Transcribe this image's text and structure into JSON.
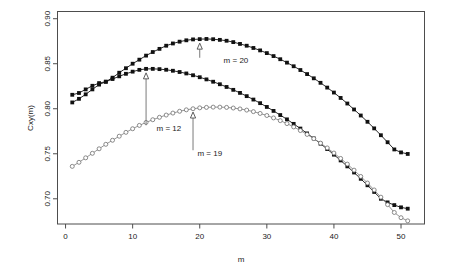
{
  "chart_data": {
    "type": "line",
    "title": "",
    "xlabel": "m",
    "ylabel": "Cxy(m)",
    "xlim": [
      -1.2,
      53.5
    ],
    "ylim": [
      0.672,
      0.908
    ],
    "grid": false,
    "legend": "none",
    "xticks": [
      "0",
      "10",
      "20",
      "30",
      "40",
      "50"
    ],
    "xtick_values": [
      0,
      10,
      20,
      30,
      40,
      50
    ],
    "yticks": [
      "0.70",
      "0.75",
      "0.80",
      "0.85",
      "0.90"
    ],
    "ytick_values": [
      0.7,
      0.75,
      0.8,
      0.85,
      0.9
    ],
    "x": [
      1,
      2,
      3,
      4,
      5,
      6,
      7,
      8,
      9,
      10,
      11,
      12,
      13,
      14,
      15,
      16,
      17,
      18,
      19,
      20,
      21,
      22,
      23,
      24,
      25,
      26,
      27,
      28,
      29,
      30,
      31,
      32,
      33,
      34,
      35,
      36,
      37,
      38,
      39,
      40,
      41,
      42,
      43,
      44,
      45,
      46,
      47,
      48,
      49,
      50,
      51
    ],
    "series": [
      {
        "name": "upper-filled-curve",
        "marker": "filled-square",
        "color": "#111111",
        "peak_m": 20,
        "values": [
          0.8155,
          0.8175,
          0.8215,
          0.8255,
          0.8285,
          0.83,
          0.8345,
          0.84,
          0.845,
          0.85,
          0.8545,
          0.859,
          0.863,
          0.8665,
          0.87,
          0.8725,
          0.8745,
          0.876,
          0.877,
          0.8773,
          0.8775,
          0.8772,
          0.8765,
          0.8755,
          0.874,
          0.872,
          0.87,
          0.8675,
          0.8648,
          0.8618,
          0.8585,
          0.855,
          0.8512,
          0.8472,
          0.843,
          0.8385,
          0.8338,
          0.8288,
          0.8235,
          0.818,
          0.812,
          0.8058,
          0.7992,
          0.7925,
          0.7855,
          0.7782,
          0.7706,
          0.7628,
          0.7548,
          0.7515,
          0.7498
        ]
      },
      {
        "name": "middle-filled-curve",
        "marker": "filled-square",
        "color": "#111111",
        "peak_m": 12,
        "values": [
          0.807,
          0.811,
          0.816,
          0.8215,
          0.8268,
          0.83,
          0.833,
          0.836,
          0.8388,
          0.8412,
          0.8432,
          0.8443,
          0.8443,
          0.844,
          0.8433,
          0.8422,
          0.8408,
          0.8392,
          0.8372,
          0.835,
          0.8326,
          0.83,
          0.8272,
          0.8242,
          0.821,
          0.8176,
          0.814,
          0.8102,
          0.8062,
          0.802,
          0.7976,
          0.793,
          0.7882,
          0.7832,
          0.778,
          0.7726,
          0.767,
          0.7612,
          0.7552,
          0.749,
          0.7426,
          0.736,
          0.7292,
          0.7222,
          0.715,
          0.7076,
          0.7,
          0.696,
          0.693,
          0.6905,
          0.689
        ]
      },
      {
        "name": "open-circle-curve",
        "marker": "open-circle",
        "color": "#8a8a8a",
        "peak_m": 19,
        "values": [
          0.736,
          0.7405,
          0.7455,
          0.7505,
          0.7555,
          0.7605,
          0.765,
          0.7695,
          0.7738,
          0.7778,
          0.7815,
          0.7848,
          0.7878,
          0.7905,
          0.793,
          0.7952,
          0.7972,
          0.7988,
          0.8,
          0.801,
          0.8015,
          0.8018,
          0.8018,
          0.8015,
          0.8008,
          0.7998,
          0.7985,
          0.7968,
          0.7948,
          0.7925,
          0.7898,
          0.7868,
          0.7835,
          0.7798,
          0.7758,
          0.7715,
          0.7668,
          0.7618,
          0.7565,
          0.7508,
          0.7448,
          0.7385,
          0.7318,
          0.7248,
          0.7175,
          0.7098,
          0.7018,
          0.6935,
          0.6848,
          0.679,
          0.6755
        ]
      }
    ],
    "annotations": [
      {
        "name": "annotation-m-20",
        "label": "m = 20",
        "target_m": 20,
        "target_y": 0.8773,
        "label_x": 25.4,
        "label_y": 0.8505
      },
      {
        "name": "annotation-m-12",
        "label": "m = 12",
        "target_m": 12,
        "target_y": 0.8443,
        "label_x": 15.4,
        "label_y": 0.7755
      },
      {
        "name": "annotation-m-19",
        "label": "m = 19",
        "target_m": 19,
        "target_y": 0.8008,
        "label_x": 21.5,
        "label_y": 0.7478
      }
    ]
  }
}
